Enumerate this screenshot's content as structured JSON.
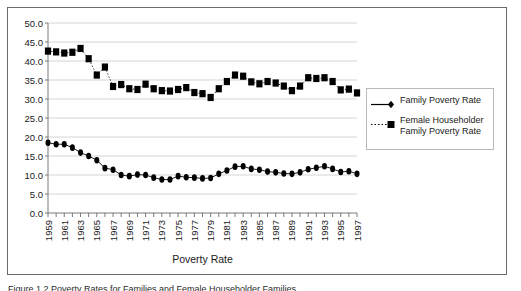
{
  "figure": {
    "caption": "Figure 1.2  Poverty Rates for Families and Female Householder Families"
  },
  "legend": {
    "position": "right",
    "items": [
      {
        "label": "Family Poverty Rate",
        "marker": "diamond",
        "line": "solid",
        "color": "#000000"
      },
      {
        "label": "Female  Householder\nFamily Poverty Rate",
        "marker": "square",
        "line": "dotted",
        "color": "#000000"
      }
    ]
  },
  "chart_data": {
    "type": "line",
    "title": "",
    "xlabel": "Poverty Rate",
    "ylabel": "",
    "grid": true,
    "legend_position": "right",
    "ylim": [
      0,
      50
    ],
    "ytick_step": 5,
    "ytick_labels": [
      "0.0",
      "5.0",
      "10.0",
      "15.0",
      "20.0",
      "25.0",
      "30.0",
      "35.0",
      "40.0",
      "45.0",
      "50.0"
    ],
    "x": [
      1959,
      1960,
      1961,
      1962,
      1963,
      1964,
      1965,
      1966,
      1967,
      1968,
      1969,
      1970,
      1971,
      1972,
      1973,
      1974,
      1975,
      1976,
      1977,
      1978,
      1979,
      1980,
      1981,
      1982,
      1983,
      1984,
      1985,
      1986,
      1987,
      1988,
      1989,
      1990,
      1991,
      1992,
      1993,
      1994,
      1995,
      1996,
      1997
    ],
    "xtick_labels": [
      "1959",
      "1961",
      "1963",
      "1965",
      "1967",
      "1969",
      "1971",
      "1973",
      "1975",
      "1977",
      "1979",
      "1981",
      "1983",
      "1985",
      "1987",
      "1989",
      "1991",
      "1993",
      "1995",
      "1997"
    ],
    "series": [
      {
        "name": "Family Poverty Rate",
        "marker": "diamond",
        "line": "solid",
        "color": "#000000",
        "values": [
          18.5,
          18.1,
          18.1,
          17.2,
          15.9,
          15.0,
          13.9,
          11.8,
          11.4,
          10.0,
          9.7,
          10.1,
          10.0,
          9.3,
          8.8,
          8.8,
          9.7,
          9.4,
          9.3,
          9.1,
          9.2,
          10.3,
          11.2,
          12.2,
          12.3,
          11.6,
          11.4,
          10.9,
          10.7,
          10.4,
          10.3,
          10.7,
          11.5,
          11.9,
          12.3,
          11.6,
          10.8,
          11.0,
          10.3
        ]
      },
      {
        "name": "Female Householder Family Poverty Rate",
        "marker": "square",
        "line": "dotted",
        "color": "#000000",
        "values": [
          42.6,
          42.4,
          42.1,
          42.3,
          43.3,
          40.6,
          36.3,
          38.4,
          33.3,
          33.8,
          32.7,
          32.5,
          33.9,
          32.7,
          32.2,
          32.1,
          32.5,
          33.0,
          31.7,
          31.4,
          30.4,
          32.7,
          34.6,
          36.3,
          36.0,
          34.5,
          34.0,
          34.6,
          34.2,
          33.4,
          32.2,
          33.4,
          35.6,
          35.4,
          35.6,
          34.6,
          32.4,
          32.6,
          31.6
        ]
      }
    ]
  }
}
